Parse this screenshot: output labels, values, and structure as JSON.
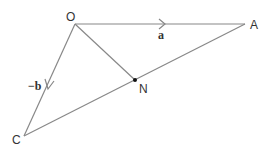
{
  "diagram": {
    "points": {
      "O": {
        "label": "O",
        "x": 75,
        "y": 24
      },
      "A": {
        "label": "A",
        "x": 245,
        "y": 24
      },
      "C": {
        "label": "C",
        "x": 24,
        "y": 136
      },
      "N": {
        "label": "N",
        "x": 135,
        "y": 80
      }
    },
    "vectors": {
      "OA": {
        "label": "a"
      },
      "OC": {
        "label": "−b"
      }
    },
    "colors": {
      "line": "#888888",
      "text": "#333333",
      "point": "#111111"
    }
  }
}
